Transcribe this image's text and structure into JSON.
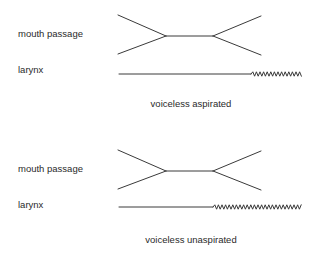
{
  "diagrams": [
    {
      "mouth_label": "mouth passage",
      "larynx_label": "larynx",
      "caption": "voiceless aspirated",
      "mouth_closure_phase": "stop closure",
      "voicing_onset": "delayed (after release)"
    },
    {
      "mouth_label": "mouth passage",
      "larynx_label": "larynx",
      "caption": "voiceless unaspirated",
      "mouth_closure_phase": "stop closure",
      "voicing_onset": "immediate (at release)"
    }
  ],
  "colors": {
    "ink": "#3a3a3a",
    "text": "#2a2a2a",
    "background": "#ffffff"
  }
}
